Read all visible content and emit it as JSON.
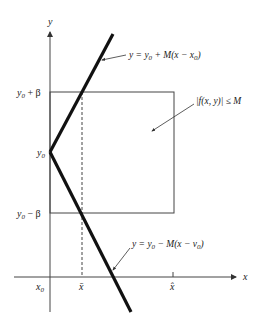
{
  "diagram": {
    "axes": {
      "x_label": "x",
      "y_label": "y"
    },
    "y_ticks": {
      "top": {
        "base": "y",
        "sub": "0",
        "rest": " + β"
      },
      "mid": {
        "base": "y",
        "sub": "0"
      },
      "bottom": {
        "base": "y",
        "sub": "0",
        "rest": " − β"
      }
    },
    "x_ticks": {
      "origin": {
        "base": "x",
        "sub": "0"
      },
      "bar": "x̄",
      "hat": "x̂"
    },
    "upper_line_label": {
      "lhs": "y = y",
      "sub1": "0",
      "mid": " + M(x − x",
      "sub2": "0",
      "end": ")"
    },
    "lower_line_label": {
      "lhs": "y = y",
      "sub1": "0",
      "mid": " − M(x − v",
      "sub2": "0",
      "end": ")"
    },
    "region_label": "|f(x, y)| ≤ M",
    "colors": {
      "ink": "#222222",
      "thin_line": "#444444",
      "background": "#ffffff"
    }
  }
}
